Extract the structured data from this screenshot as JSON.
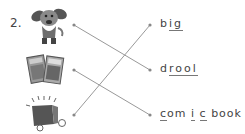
{
  "exercise": {
    "number": "2.",
    "pictures": [
      {
        "id": "dog",
        "icon": "drooling-dog-icon"
      },
      {
        "id": "comics",
        "icon": "comic-books-icon"
      },
      {
        "id": "box",
        "icon": "big-box-icon"
      }
    ],
    "words": [
      {
        "text": "big",
        "parts": [
          "b",
          "i",
          "g"
        ],
        "blanks": [
          1,
          2
        ]
      },
      {
        "text": "drool",
        "parts": [
          "d",
          "r",
          "o",
          "o",
          "l"
        ],
        "blanks": [
          1,
          2,
          3,
          4
        ]
      },
      {
        "text": "comic book",
        "parts": [
          "c",
          "om",
          "i",
          "c",
          " book"
        ],
        "blanks": [
          0,
          2,
          3
        ]
      }
    ],
    "matches": [
      {
        "picture": "dog",
        "word": "drool"
      },
      {
        "picture": "comics",
        "word": "comic book"
      },
      {
        "picture": "box",
        "word": "big"
      }
    ]
  },
  "colors": {
    "line": "#999999",
    "dot": "#888888",
    "text": "#444444"
  }
}
